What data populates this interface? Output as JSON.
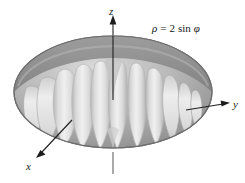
{
  "figure": {
    "name": "spherical-surface-plot",
    "equation_label": {
      "rho": "ρ",
      "equals": "=",
      "coefficient": "2",
      "function": "sin",
      "phi": "φ",
      "full_text": "ρ = 2 sin φ"
    },
    "axes": [
      {
        "id": "z",
        "label": "z",
        "direction": "up",
        "arrow": true
      },
      {
        "id": "y",
        "label": "y",
        "direction": "right",
        "arrow": true
      },
      {
        "id": "x",
        "label": "x",
        "direction": "down-left",
        "arrow": true
      }
    ],
    "surface": {
      "description": "lobed torus-like surface of revolution",
      "lobe_count": 11,
      "shading": "grayscale"
    },
    "colors": {
      "background": "#ffffff",
      "outer_shell_dark": "#8b8b8b",
      "outer_shell_mid": "#a8a8a8",
      "outer_shell_light": "#c9c9c9",
      "lobe_light": "#e4e4e4",
      "lobe_highlight": "#f2f2f2",
      "lobe_shadow": "#b4b4b4",
      "outline": "#6d6d6d",
      "axis_line": "#222222",
      "text": "#161616"
    }
  }
}
